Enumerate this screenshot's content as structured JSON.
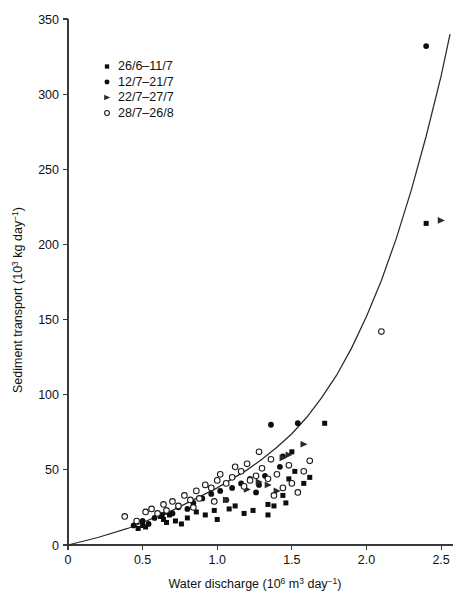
{
  "chart_data": {
    "type": "scatter",
    "title": "",
    "xlabel": "Water discharge (10^6 m^3 day^-1)",
    "ylabel": "Sediment transport (10^3 kg day^-1)",
    "xlabel_parts": {
      "pre": "Water discharge (10",
      "sup1": "6",
      "mid": " m",
      "sup2": "3",
      "mid2": " day",
      "sup3": "−1",
      "post": ")"
    },
    "ylabel_parts": {
      "pre": "Sediment transport (10",
      "sup1": "3",
      "mid": " kg day",
      "sup2": "−1",
      "post": ")"
    },
    "xlim": [
      0,
      2.6
    ],
    "ylim": [
      0,
      350
    ],
    "xticks": [
      0,
      0.5,
      1.0,
      1.5,
      2.0,
      2.5
    ],
    "xticklabels": [
      "0",
      "0.5",
      "1.0",
      "1.5",
      "2.0",
      "2.5"
    ],
    "yticks": [
      0,
      50,
      100,
      150,
      200,
      250,
      300,
      350
    ],
    "yticklabels": [
      "0",
      "50",
      "100",
      "150",
      "200",
      "250",
      "300",
      "350"
    ],
    "grid": false,
    "legend_position": "upper-left-inset",
    "series": [
      {
        "name": "26/6–11/7",
        "marker": "filled-square",
        "points": [
          [
            0.47,
            11
          ],
          [
            0.5,
            13
          ],
          [
            0.52,
            12
          ],
          [
            0.62,
            19
          ],
          [
            0.64,
            17
          ],
          [
            0.66,
            15
          ],
          [
            0.68,
            20
          ],
          [
            0.72,
            16
          ],
          [
            0.76,
            14
          ],
          [
            0.8,
            18
          ],
          [
            0.86,
            22
          ],
          [
            0.92,
            20
          ],
          [
            1.0,
            17
          ],
          [
            1.08,
            24
          ],
          [
            1.18,
            21
          ],
          [
            1.24,
            23
          ],
          [
            1.34,
            27
          ],
          [
            1.38,
            26
          ],
          [
            1.44,
            33
          ],
          [
            1.48,
            44
          ],
          [
            1.52,
            49
          ],
          [
            1.58,
            41
          ],
          [
            1.62,
            45
          ],
          [
            1.72,
            81
          ],
          [
            1.5,
            62
          ],
          [
            1.46,
            28
          ],
          [
            2.4,
            214
          ],
          [
            1.34,
            20
          ],
          [
            1.12,
            26
          ],
          [
            0.98,
            23
          ]
        ]
      },
      {
        "name": "12/7–21/7",
        "marker": "filled-circle",
        "points": [
          [
            0.44,
            13
          ],
          [
            0.5,
            16
          ],
          [
            0.54,
            14
          ],
          [
            0.58,
            18
          ],
          [
            0.63,
            20
          ],
          [
            0.66,
            22
          ],
          [
            0.7,
            21
          ],
          [
            0.74,
            25
          ],
          [
            0.8,
            24
          ],
          [
            0.84,
            28
          ],
          [
            0.9,
            31
          ],
          [
            0.96,
            34
          ],
          [
            1.02,
            36
          ],
          [
            1.06,
            30
          ],
          [
            1.1,
            38
          ],
          [
            1.16,
            41
          ],
          [
            1.22,
            44
          ],
          [
            1.28,
            40
          ],
          [
            1.32,
            46
          ],
          [
            1.36,
            80
          ],
          [
            1.42,
            52
          ],
          [
            1.44,
            59
          ],
          [
            1.26,
            35
          ],
          [
            1.54,
            81
          ],
          [
            2.4,
            332
          ]
        ]
      },
      {
        "name": "22/7–27/7",
        "marker": "right-triangle",
        "points": [
          [
            1.06,
            30
          ],
          [
            1.2,
            37
          ],
          [
            1.28,
            42
          ],
          [
            1.4,
            36
          ],
          [
            1.44,
            58
          ],
          [
            1.48,
            60
          ],
          [
            1.58,
            67
          ],
          [
            2.5,
            216
          ],
          [
            1.34,
            40
          ]
        ]
      },
      {
        "name": "28/7–26/8",
        "marker": "open-circle",
        "points": [
          [
            0.38,
            19
          ],
          [
            0.46,
            16
          ],
          [
            0.52,
            22
          ],
          [
            0.56,
            24
          ],
          [
            0.6,
            21
          ],
          [
            0.64,
            27
          ],
          [
            0.66,
            23
          ],
          [
            0.7,
            29
          ],
          [
            0.74,
            26
          ],
          [
            0.78,
            33
          ],
          [
            0.82,
            30
          ],
          [
            0.86,
            36
          ],
          [
            0.88,
            31
          ],
          [
            0.92,
            40
          ],
          [
            0.96,
            38
          ],
          [
            1.0,
            43
          ],
          [
            1.02,
            47
          ],
          [
            1.06,
            41
          ],
          [
            1.1,
            45
          ],
          [
            1.12,
            52
          ],
          [
            1.16,
            49
          ],
          [
            1.2,
            54
          ],
          [
            1.22,
            43
          ],
          [
            1.26,
            46
          ],
          [
            1.3,
            51
          ],
          [
            1.34,
            44
          ],
          [
            1.36,
            57
          ],
          [
            1.4,
            47
          ],
          [
            1.44,
            38
          ],
          [
            1.48,
            53
          ],
          [
            1.5,
            41
          ],
          [
            1.54,
            35
          ],
          [
            1.58,
            49
          ],
          [
            1.62,
            56
          ],
          [
            2.1,
            142
          ],
          [
            1.28,
            62
          ],
          [
            1.18,
            39
          ],
          [
            0.98,
            29
          ],
          [
            0.84,
            25
          ],
          [
            1.38,
            33
          ]
        ]
      }
    ],
    "fit_curve": {
      "description": "power-law regression curve through the data",
      "points": [
        [
          0.0,
          0
        ],
        [
          0.2,
          5
        ],
        [
          0.4,
          11
        ],
        [
          0.5,
          15
        ],
        [
          0.6,
          19
        ],
        [
          0.7,
          23
        ],
        [
          0.8,
          28
        ],
        [
          0.9,
          33
        ],
        [
          1.0,
          38
        ],
        [
          1.1,
          44
        ],
        [
          1.2,
          50
        ],
        [
          1.3,
          57
        ],
        [
          1.4,
          65
        ],
        [
          1.5,
          74
        ],
        [
          1.6,
          85
        ],
        [
          1.7,
          98
        ],
        [
          1.8,
          113
        ],
        [
          1.9,
          131
        ],
        [
          2.0,
          152
        ],
        [
          2.1,
          176
        ],
        [
          2.2,
          204
        ],
        [
          2.3,
          236
        ],
        [
          2.4,
          272
        ],
        [
          2.5,
          312
        ],
        [
          2.56,
          340
        ]
      ]
    }
  },
  "legend": {
    "items": [
      {
        "label": "26/6–11/7",
        "marker": "filled-square"
      },
      {
        "label": "12/7–21/7",
        "marker": "filled-circle"
      },
      {
        "label": "22/7–27/7",
        "marker": "right-triangle"
      },
      {
        "label": "28/7–26/8",
        "marker": "open-circle"
      }
    ]
  }
}
